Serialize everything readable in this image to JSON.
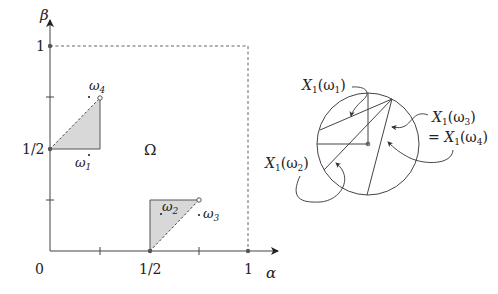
{
  "left_diagram": {
    "axes": {
      "x_label": "α",
      "y_label": "β",
      "origin_label": "0",
      "x_ticks": [
        {
          "value": 0.5,
          "label": "1/2"
        },
        {
          "value": 1,
          "label": "1"
        }
      ],
      "y_ticks": [
        {
          "value": 0.5,
          "label": "1/2"
        },
        {
          "value": 1,
          "label": "1"
        }
      ],
      "minor_ticks": [
        0.25,
        0.75
      ]
    },
    "region_label": "Ω",
    "shaded_triangles": [
      {
        "vertices": [
          [
            0,
            0.5
          ],
          [
            0.25,
            0.5
          ],
          [
            0.25,
            0.75
          ]
        ],
        "dashed_edge": "hypotenuse"
      },
      {
        "vertices": [
          [
            0.5,
            0
          ],
          [
            0.5,
            0.25
          ],
          [
            0.75,
            0.25
          ]
        ],
        "dashed_edge": "hypotenuse"
      }
    ],
    "points": {
      "w1": {
        "label": "ω",
        "sub": "1"
      },
      "w2": {
        "label": "ω",
        "sub": "2"
      },
      "w3": {
        "label": "ω",
        "sub": "3"
      },
      "w4": {
        "label": "ω",
        "sub": "4"
      }
    },
    "boundary": "dashed unit square"
  },
  "right_diagram": {
    "labels": {
      "x1w1": {
        "main": "X",
        "sub": "1",
        "arg": "(ω",
        "argsub": "1",
        "close": ")"
      },
      "x1w2": {
        "main": "X",
        "sub": "1",
        "arg": "(ω",
        "argsub": "2",
        "close": ")"
      },
      "x1w3": {
        "main": "X",
        "sub": "1",
        "arg": "(ω",
        "argsub": "3",
        "close": ")"
      },
      "x1w4": {
        "prefix": "= ",
        "main": "X",
        "sub": "1",
        "arg": "(ω",
        "argsub": "4",
        "close": ")"
      }
    }
  }
}
